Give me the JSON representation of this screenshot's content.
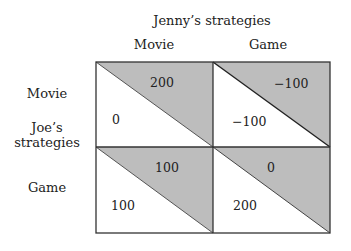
{
  "title": "Jenny’s strategies",
  "column_headers": [
    "Movie",
    "Game"
  ],
  "row_label": [
    "Joe’s",
    "strategies"
  ],
  "row_headers": [
    "Movie",
    "Game"
  ],
  "colors": {
    "shade": "#bdbdbd",
    "line": "#333333",
    "background": "#ffffff"
  },
  "cells": [
    {
      "row": "Movie",
      "col": "Movie",
      "jenny_payoff": "200",
      "joe_payoff": "0"
    },
    {
      "row": "Movie",
      "col": "Game",
      "jenny_payoff": "−100",
      "joe_payoff": "−100"
    },
    {
      "row": "Game",
      "col": "Movie",
      "jenny_payoff": "100",
      "joe_payoff": "100"
    },
    {
      "row": "Game",
      "col": "Game",
      "jenny_payoff": "0",
      "joe_payoff": "200"
    }
  ]
}
